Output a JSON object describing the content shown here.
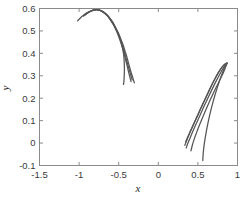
{
  "chart_data": {
    "type": "line",
    "title": "",
    "xlabel": "x",
    "ylabel": "y",
    "xlim": [
      -1.5,
      1.0
    ],
    "ylim": [
      -0.1,
      0.6
    ],
    "xticks": [
      -1.5,
      -1,
      -0.5,
      0,
      0.5,
      1
    ],
    "xticklabels": [
      "-1.5",
      "-1",
      "-0.5",
      "0",
      "0.5",
      "1"
    ],
    "yticks": [
      -0.1,
      0,
      0.1,
      0.2,
      0.3,
      0.4,
      0.5,
      0.6
    ],
    "yticklabels": [
      "-0.1",
      "0",
      "0.1",
      "0.2",
      "0.3",
      "0.4",
      "0.5",
      "0.6"
    ],
    "grid": false,
    "legend": null,
    "line_color": "#555555",
    "axes_color": "#8a8a8a",
    "background": "#ffffff",
    "series": [
      {
        "name": "upper-branch-1",
        "points": [
          [
            -1.02,
            0.545
          ],
          [
            -0.975,
            0.561
          ],
          [
            -0.93,
            0.574
          ],
          [
            -0.885,
            0.584
          ],
          [
            -0.84,
            0.591
          ],
          [
            -0.8,
            0.594
          ],
          [
            -0.77,
            0.595
          ],
          [
            -0.735,
            0.592
          ],
          [
            -0.7,
            0.586
          ],
          [
            -0.665,
            0.577
          ],
          [
            -0.63,
            0.564
          ],
          [
            -0.6,
            0.55
          ],
          [
            -0.565,
            0.531
          ],
          [
            -0.535,
            0.51
          ],
          [
            -0.505,
            0.486
          ],
          [
            -0.48,
            0.462
          ],
          [
            -0.46,
            0.438
          ],
          [
            -0.445,
            0.412
          ],
          [
            -0.435,
            0.386
          ],
          [
            -0.43,
            0.358
          ],
          [
            -0.428,
            0.33
          ],
          [
            -0.43,
            0.3
          ],
          [
            -0.435,
            0.272
          ],
          [
            -0.44,
            0.262
          ]
        ]
      },
      {
        "name": "upper-branch-2",
        "points": [
          [
            -0.95,
            0.565
          ],
          [
            -0.9,
            0.578
          ],
          [
            -0.855,
            0.587
          ],
          [
            -0.815,
            0.593
          ],
          [
            -0.78,
            0.595
          ],
          [
            -0.745,
            0.593
          ],
          [
            -0.71,
            0.588
          ],
          [
            -0.675,
            0.58
          ],
          [
            -0.64,
            0.569
          ],
          [
            -0.605,
            0.554
          ],
          [
            -0.57,
            0.536
          ],
          [
            -0.54,
            0.516
          ],
          [
            -0.505,
            0.492
          ],
          [
            -0.475,
            0.466
          ],
          [
            -0.445,
            0.438
          ],
          [
            -0.42,
            0.41
          ],
          [
            -0.395,
            0.382
          ],
          [
            -0.375,
            0.355
          ],
          [
            -0.355,
            0.33
          ],
          [
            -0.34,
            0.31
          ],
          [
            -0.325,
            0.295
          ],
          [
            -0.315,
            0.283
          ],
          [
            -0.308,
            0.275
          ],
          [
            -0.303,
            0.268
          ]
        ]
      },
      {
        "name": "upper-branch-3",
        "points": [
          [
            -0.94,
            0.568
          ],
          [
            -0.895,
            0.58
          ],
          [
            -0.85,
            0.589
          ],
          [
            -0.81,
            0.593
          ],
          [
            -0.775,
            0.595
          ],
          [
            -0.74,
            0.592
          ],
          [
            -0.705,
            0.586
          ],
          [
            -0.67,
            0.577
          ],
          [
            -0.635,
            0.565
          ],
          [
            -0.6,
            0.549
          ],
          [
            -0.57,
            0.531
          ],
          [
            -0.535,
            0.509
          ],
          [
            -0.505,
            0.485
          ],
          [
            -0.475,
            0.458
          ],
          [
            -0.45,
            0.43
          ],
          [
            -0.425,
            0.402
          ],
          [
            -0.405,
            0.375
          ],
          [
            -0.385,
            0.35
          ],
          [
            -0.368,
            0.328
          ],
          [
            -0.355,
            0.312
          ],
          [
            -0.345,
            0.3
          ],
          [
            -0.338,
            0.292
          ],
          [
            -0.333,
            0.286
          ],
          [
            -0.33,
            0.282
          ]
        ]
      },
      {
        "name": "upper-branch-4",
        "points": [
          [
            -0.93,
            0.571
          ],
          [
            -0.885,
            0.582
          ],
          [
            -0.845,
            0.59
          ],
          [
            -0.805,
            0.594
          ],
          [
            -0.77,
            0.595
          ],
          [
            -0.735,
            0.592
          ],
          [
            -0.7,
            0.585
          ],
          [
            -0.665,
            0.575
          ],
          [
            -0.63,
            0.562
          ],
          [
            -0.6,
            0.546
          ],
          [
            -0.565,
            0.527
          ],
          [
            -0.535,
            0.505
          ],
          [
            -0.505,
            0.48
          ],
          [
            -0.478,
            0.453
          ],
          [
            -0.452,
            0.424
          ],
          [
            -0.43,
            0.396
          ],
          [
            -0.41,
            0.368
          ],
          [
            -0.392,
            0.343
          ],
          [
            -0.378,
            0.321
          ],
          [
            -0.366,
            0.304
          ],
          [
            -0.357,
            0.292
          ],
          [
            -0.351,
            0.284
          ],
          [
            -0.347,
            0.278
          ],
          [
            -0.344,
            0.274
          ]
        ]
      },
      {
        "name": "lower-branch-1",
        "points": [
          [
            0.345,
            0.005
          ],
          [
            0.365,
            0.022
          ],
          [
            0.39,
            0.042
          ],
          [
            0.42,
            0.065
          ],
          [
            0.455,
            0.092
          ],
          [
            0.49,
            0.118
          ],
          [
            0.525,
            0.145
          ],
          [
            0.56,
            0.172
          ],
          [
            0.6,
            0.202
          ],
          [
            0.64,
            0.232
          ],
          [
            0.68,
            0.262
          ],
          [
            0.72,
            0.29
          ],
          [
            0.76,
            0.315
          ],
          [
            0.79,
            0.332
          ],
          [
            0.82,
            0.345
          ],
          [
            0.845,
            0.352
          ],
          [
            0.865,
            0.356
          ]
        ]
      },
      {
        "name": "lower-branch-2",
        "points": [
          [
            0.335,
            -0.01
          ],
          [
            0.355,
            0.008
          ],
          [
            0.38,
            0.03
          ],
          [
            0.41,
            0.055
          ],
          [
            0.445,
            0.083
          ],
          [
            0.48,
            0.111
          ],
          [
            0.515,
            0.139
          ],
          [
            0.552,
            0.168
          ],
          [
            0.592,
            0.198
          ],
          [
            0.632,
            0.228
          ],
          [
            0.673,
            0.258
          ],
          [
            0.714,
            0.286
          ],
          [
            0.755,
            0.312
          ],
          [
            0.788,
            0.33
          ],
          [
            0.818,
            0.344
          ],
          [
            0.843,
            0.352
          ],
          [
            0.863,
            0.356
          ]
        ]
      },
      {
        "name": "lower-branch-3",
        "points": [
          [
            0.352,
            -0.022
          ],
          [
            0.372,
            -0.002
          ],
          [
            0.4,
            0.022
          ],
          [
            0.432,
            0.049
          ],
          [
            0.468,
            0.078
          ],
          [
            0.505,
            0.107
          ],
          [
            0.542,
            0.136
          ],
          [
            0.58,
            0.166
          ],
          [
            0.62,
            0.196
          ],
          [
            0.66,
            0.226
          ],
          [
            0.7,
            0.255
          ],
          [
            0.74,
            0.283
          ],
          [
            0.778,
            0.308
          ],
          [
            0.81,
            0.328
          ],
          [
            0.835,
            0.343
          ],
          [
            0.855,
            0.352
          ],
          [
            0.868,
            0.356
          ]
        ]
      },
      {
        "name": "lower-branch-4",
        "points": [
          [
            0.412,
            -0.035
          ],
          [
            0.428,
            -0.012
          ],
          [
            0.45,
            0.014
          ],
          [
            0.478,
            0.042
          ],
          [
            0.51,
            0.072
          ],
          [
            0.545,
            0.102
          ],
          [
            0.582,
            0.133
          ],
          [
            0.62,
            0.164
          ],
          [
            0.658,
            0.194
          ],
          [
            0.696,
            0.223
          ],
          [
            0.734,
            0.251
          ],
          [
            0.772,
            0.278
          ],
          [
            0.806,
            0.302
          ],
          [
            0.833,
            0.324
          ],
          [
            0.852,
            0.341
          ],
          [
            0.864,
            0.351
          ],
          [
            0.87,
            0.356
          ]
        ]
      },
      {
        "name": "lower-branch-5",
        "points": [
          [
            0.562,
            -0.078
          ],
          [
            0.565,
            -0.055
          ],
          [
            0.572,
            -0.028
          ],
          [
            0.583,
            0.002
          ],
          [
            0.598,
            0.035
          ],
          [
            0.616,
            0.07
          ],
          [
            0.637,
            0.106
          ],
          [
            0.661,
            0.142
          ],
          [
            0.687,
            0.178
          ],
          [
            0.714,
            0.212
          ],
          [
            0.742,
            0.244
          ],
          [
            0.77,
            0.274
          ],
          [
            0.798,
            0.302
          ],
          [
            0.822,
            0.325
          ],
          [
            0.842,
            0.342
          ],
          [
            0.858,
            0.352
          ],
          [
            0.868,
            0.357
          ]
        ]
      }
    ]
  }
}
